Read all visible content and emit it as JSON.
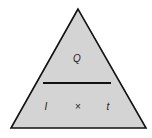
{
  "diagram": {
    "type": "formula-triangle",
    "colors": {
      "fill": "#d4d4d4",
      "stroke": "#111111",
      "background": "#ffffff"
    },
    "top": {
      "label": "Q"
    },
    "bottom": {
      "left": "I",
      "operator": "×",
      "right": "t"
    }
  }
}
